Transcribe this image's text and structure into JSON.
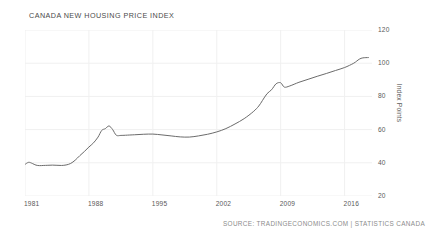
{
  "title": "CANADA NEW HOUSING PRICE INDEX",
  "source_note": "SOURCE: TRADINGECONOMICS.COM | STATISTICS CANADA",
  "colors": {
    "line": "#6b6b6b",
    "grid": "#f0f0f0",
    "text": "#5a5a5a",
    "title_text": "#4a4a4a",
    "source_text": "#8c8c8c",
    "background": "#ffffff"
  },
  "chart_data": {
    "type": "line",
    "title": "CANADA NEW HOUSING PRICE INDEX",
    "xlabel": "",
    "ylabel": "Index Points",
    "ylim": [
      20,
      120
    ],
    "xlim": [
      1981,
      2019
    ],
    "grid": true,
    "legend": "none",
    "yticks": [
      120,
      100,
      80,
      60,
      40,
      20
    ],
    "xticks": [
      1981,
      1988,
      1995,
      2002,
      2009,
      2016
    ],
    "series": [
      {
        "name": "New Housing Price Index",
        "x": [
          1981.0,
          1981.4,
          1981.8,
          1982.2,
          1982.6,
          1983.0,
          1983.5,
          1984.0,
          1984.5,
          1985.0,
          1985.5,
          1986.0,
          1986.5,
          1987.0,
          1987.5,
          1988.0,
          1988.5,
          1989.0,
          1989.4,
          1989.8,
          1990.2,
          1990.6,
          1991.0,
          1991.5,
          1992.0,
          1993.0,
          1994.0,
          1995.0,
          1996.0,
          1997.0,
          1998.0,
          1999.0,
          2000.0,
          2001.0,
          2002.0,
          2003.0,
          2004.0,
          2005.0,
          2006.0,
          2006.6,
          2007.0,
          2007.5,
          2008.0,
          2008.5,
          2009.0,
          2009.4,
          2010.0,
          2011.0,
          2012.0,
          2013.0,
          2014.0,
          2015.0,
          2016.0,
          2017.0,
          2017.6,
          2018.0,
          2018.6
        ],
        "y": [
          39.0,
          40.3,
          39.6,
          38.6,
          38.3,
          38.4,
          38.5,
          38.6,
          38.5,
          38.4,
          38.7,
          39.6,
          41.6,
          44.3,
          46.8,
          49.5,
          52.0,
          55.5,
          59.5,
          60.6,
          62.2,
          60.0,
          56.6,
          56.5,
          56.6,
          56.9,
          57.2,
          57.3,
          56.8,
          56.2,
          55.6,
          55.5,
          56.2,
          57.2,
          58.6,
          60.6,
          63.4,
          66.6,
          70.8,
          74.2,
          77.5,
          81.6,
          84.0,
          87.6,
          88.2,
          85.6,
          86.3,
          88.5,
          90.3,
          92.1,
          93.8,
          95.6,
          97.4,
          100.0,
          102.4,
          103.2,
          103.4
        ]
      }
    ]
  }
}
